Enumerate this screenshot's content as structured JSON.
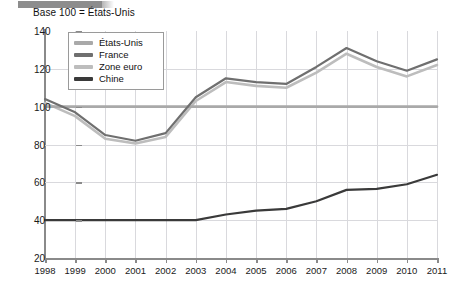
{
  "figure": {
    "title": "Base 100 = États-Unis",
    "top_bar_color": "#8d8d8d"
  },
  "legend": {
    "position": "top-left-inside",
    "items": [
      {
        "label": "États-Unis",
        "color": "#a9a9a9"
      },
      {
        "label": "France",
        "color": "#6f6f6f"
      },
      {
        "label": "Zone euro",
        "color": "#bdbdbd"
      },
      {
        "label": "Chine",
        "color": "#3a3a3a"
      }
    ]
  },
  "chart_data": {
    "type": "line",
    "title": "Base 100 = États-Unis",
    "xlabel": "",
    "ylabel": "",
    "x": [
      1998,
      1999,
      2000,
      2001,
      2002,
      2003,
      2004,
      2005,
      2006,
      2007,
      2008,
      2009,
      2010,
      2011
    ],
    "categories": [
      "1998",
      "1999",
      "2000",
      "2001",
      "2002",
      "2003",
      "2004",
      "2005",
      "2006",
      "2007",
      "2008",
      "2009",
      "2010",
      "2011"
    ],
    "xlim": [
      1998,
      2011
    ],
    "ylim": [
      20,
      140
    ],
    "yticks": [
      20,
      40,
      60,
      80,
      100,
      120,
      140
    ],
    "xticks": [
      1998,
      1999,
      2000,
      2001,
      2002,
      2003,
      2004,
      2005,
      2006,
      2007,
      2008,
      2009,
      2010,
      2011
    ],
    "grid": true,
    "legend_position": "upper left",
    "series": [
      {
        "name": "États-Unis",
        "color": "#a9a9a9",
        "width": 2.6,
        "values": [
          100,
          100,
          100,
          100,
          100,
          100,
          100,
          100,
          100,
          100,
          100,
          100,
          100,
          100
        ]
      },
      {
        "name": "France",
        "color": "#6f6f6f",
        "width": 2.2,
        "values": [
          104,
          97,
          85,
          82,
          86,
          105,
          115,
          113,
          112,
          121,
          131,
          124,
          119,
          125
        ]
      },
      {
        "name": "Zone euro",
        "color": "#bdbdbd",
        "width": 2.6,
        "values": [
          102,
          95,
          83,
          80.5,
          84,
          103,
          113,
          111,
          110,
          118,
          128,
          121,
          116,
          122
        ]
      },
      {
        "name": "Chine",
        "color": "#3a3a3a",
        "width": 2.2,
        "values": [
          40,
          40,
          40,
          40,
          40,
          40,
          43,
          45,
          46,
          50,
          56,
          56.5,
          59,
          64
        ]
      }
    ]
  }
}
